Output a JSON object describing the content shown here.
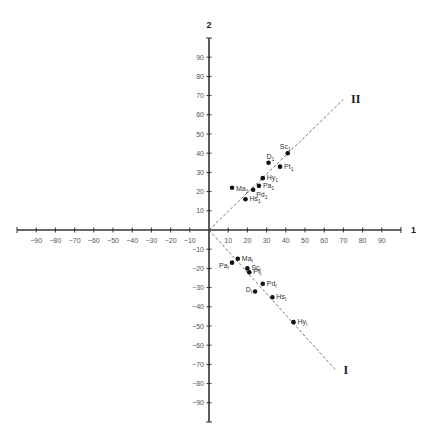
{
  "chart_data": {
    "type": "scatter",
    "title": "",
    "xlabel": "1",
    "ylabel": "2",
    "xlim": [
      -100,
      100
    ],
    "ylim": [
      -100,
      100
    ],
    "grid": false,
    "x_ticks": [
      -90,
      -80,
      -70,
      -60,
      -50,
      -40,
      -30,
      -20,
      -10,
      10,
      20,
      30,
      40,
      50,
      60,
      70,
      80,
      90
    ],
    "y_ticks": [
      90,
      80,
      70,
      60,
      50,
      40,
      30,
      20,
      10,
      -10,
      -20,
      -30,
      -40,
      -50,
      -60,
      -70,
      -80,
      -90
    ],
    "lines": [
      {
        "name": "II",
        "from": [
          0,
          0
        ],
        "to": [
          70,
          68
        ],
        "style": "dashed"
      },
      {
        "name": "I",
        "from": [
          0,
          0
        ],
        "to": [
          66,
          -73
        ],
        "style": "dashed"
      }
    ],
    "series": [
      {
        "name": "Factor II group",
        "points": [
          {
            "label": "Sc",
            "sub": "1",
            "x": 41,
            "y": 40
          },
          {
            "label": "D",
            "sub": "1",
            "x": 31,
            "y": 35
          },
          {
            "label": "Pt",
            "sub": "1",
            "x": 37,
            "y": 33
          },
          {
            "label": "Hy",
            "sub": "1",
            "x": 28,
            "y": 27
          },
          {
            "label": "Pa",
            "sub": "1",
            "x": 26,
            "y": 23
          },
          {
            "label": "Pd",
            "sub": "1",
            "x": 23,
            "y": 21
          },
          {
            "label": "Ma",
            "sub": "1",
            "x": 12,
            "y": 22
          },
          {
            "label": "Hs",
            "sub": "1",
            "x": 19,
            "y": 16
          }
        ]
      },
      {
        "name": "Factor I group",
        "points": [
          {
            "label": "Ma",
            "sub": "I",
            "x": 15,
            "y": -15
          },
          {
            "label": "Pa",
            "sub": "I",
            "x": 12,
            "y": -17
          },
          {
            "label": "Sc",
            "sub": "I",
            "x": 20,
            "y": -20
          },
          {
            "label": "Pt",
            "sub": "I",
            "x": 21,
            "y": -22
          },
          {
            "label": "Pd",
            "sub": "I",
            "x": 28,
            "y": -28
          },
          {
            "label": "D",
            "sub": "I",
            "x": 24,
            "y": -32
          },
          {
            "label": "Hs",
            "sub": "I",
            "x": 33,
            "y": -35
          },
          {
            "label": "Hy",
            "sub": "I",
            "x": 44,
            "y": -48
          }
        ]
      }
    ],
    "annotations": [
      {
        "text": "II",
        "x": 74,
        "y": 68
      },
      {
        "text": "I",
        "x": 70,
        "y": -73
      }
    ]
  }
}
